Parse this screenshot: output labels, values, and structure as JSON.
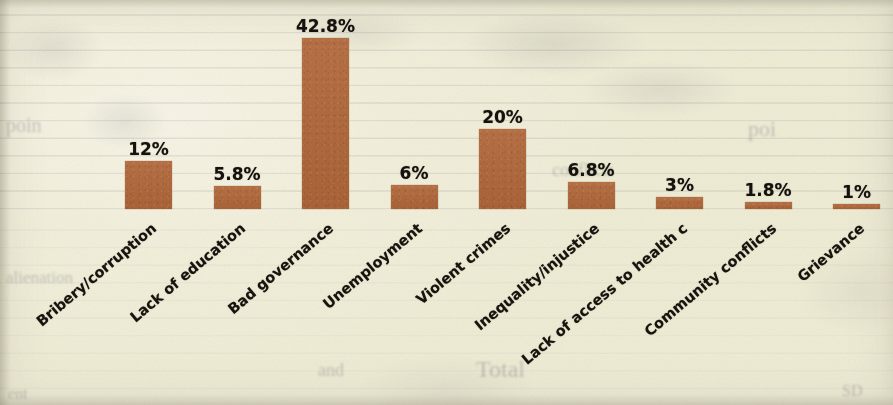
{
  "chart_data": {
    "type": "bar",
    "title": "",
    "subtitle": "",
    "xlabel": "",
    "ylabel": "",
    "ylim": [
      0,
      45
    ],
    "grid": false,
    "legend": "none",
    "orientation": "vertical",
    "bar_color": "#b0673a",
    "categories": [
      "Bribery/corruption",
      "Lack of education",
      "Bad governance",
      "Unemployment",
      "Violent crimes",
      "Inequality/injustice",
      "Lack of access to health c",
      "Community conflicts",
      "Grievance"
    ],
    "values": [
      12,
      5.8,
      42.8,
      6,
      20,
      6.8,
      3,
      1.8,
      1
    ],
    "data_labels": [
      "12%",
      "5.8%",
      "42.8%",
      "6%",
      "20%",
      "6.8%",
      "3%",
      "1.8%",
      "1%"
    ],
    "value_unit": "%"
  },
  "page": {
    "background_color": "#f2efdc",
    "media": "scanned-paper",
    "ghost_text": [
      {
        "text": "poin",
        "x": 6,
        "y": 114,
        "size": 20,
        "rotate": 0
      },
      {
        "text": "poi",
        "x": 748,
        "y": 116,
        "size": 22,
        "rotate": 0
      },
      {
        "text": "Total",
        "x": 476,
        "y": 356,
        "size": 24,
        "rotate": 0
      },
      {
        "text": "and",
        "x": 318,
        "y": 360,
        "size": 18,
        "rotate": 0
      },
      {
        "text": "alienation",
        "x": 6,
        "y": 268,
        "size": 17,
        "rotate": 0
      },
      {
        "text": "ent",
        "x": 8,
        "y": 385,
        "size": 16,
        "rotate": 0
      },
      {
        "text": "conflicts",
        "x": 552,
        "y": 160,
        "size": 18,
        "rotate": 0
      },
      {
        "text": "SD",
        "x": 842,
        "y": 382,
        "size": 16,
        "rotate": 0
      }
    ]
  },
  "axes": {
    "baseline_y": 209,
    "px_per_percent": 4.0,
    "first_bar_left": 125,
    "bar_pitch": 88.5,
    "bar_width": 47,
    "label_rotation_deg": -40
  }
}
